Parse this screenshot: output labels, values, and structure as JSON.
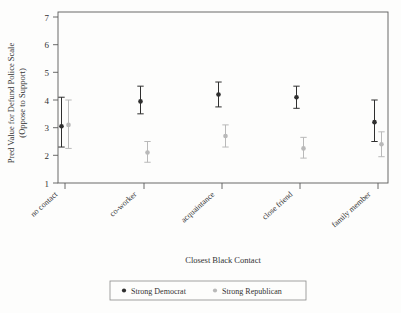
{
  "chart_data": {
    "type": "scatter",
    "title": "",
    "xlabel": "Closest Black Contact",
    "ylabel_line1": "Pred Value for Defund Police Scale",
    "ylabel_line2": "(Oppose to Support)",
    "categories": [
      "no contact",
      "co-worker",
      "acquaintance",
      "close friend",
      "family member"
    ],
    "ylim": [
      1,
      7
    ],
    "yticks": [
      1,
      2,
      3,
      4,
      5,
      6,
      7
    ],
    "ytick_labels": [
      "1",
      "2",
      "3",
      "4",
      "5",
      "6",
      "7"
    ],
    "grid": false,
    "legend_position": "bottom",
    "series": [
      {
        "name": "Strong Democrat",
        "color": "#2f2f2f",
        "marker": "circle",
        "values": [
          3.05,
          3.95,
          4.2,
          4.1,
          3.2
        ],
        "ci_low": [
          2.3,
          3.5,
          3.75,
          3.7,
          2.5
        ],
        "ci_high": [
          4.1,
          4.5,
          4.65,
          4.5,
          4.0
        ]
      },
      {
        "name": "Strong Republican",
        "color": "#b9b9b9",
        "marker": "circle",
        "values": [
          3.1,
          2.1,
          2.7,
          2.25,
          2.4
        ],
        "ci_low": [
          2.25,
          1.75,
          2.3,
          1.9,
          1.95
        ],
        "ci_high": [
          4.0,
          2.5,
          3.1,
          2.65,
          2.85
        ]
      }
    ]
  },
  "legend": {
    "entries": [
      {
        "label": "Strong Democrat",
        "color": "#2f2f2f"
      },
      {
        "label": "Strong Republican",
        "color": "#b9b9b9"
      }
    ]
  }
}
